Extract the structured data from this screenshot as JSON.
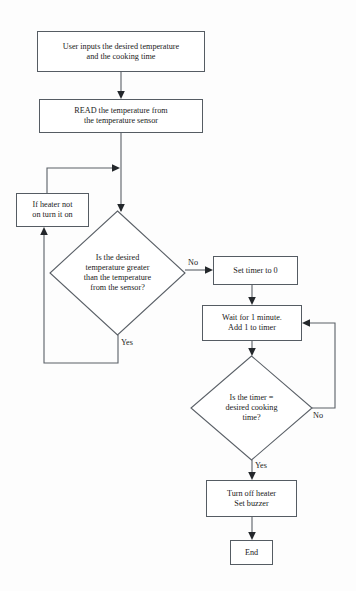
{
  "diagram": {
    "type": "flowchart",
    "nodes": [
      {
        "id": "input",
        "shape": "process",
        "lines": [
          "User inputs the desired temperature",
          "and the cooking time"
        ]
      },
      {
        "id": "read",
        "shape": "process",
        "lines": [
          "READ the temperature from",
          "the temperature sensor"
        ]
      },
      {
        "id": "heater",
        "shape": "process",
        "lines": [
          "If heater not",
          "on turn it on"
        ]
      },
      {
        "id": "decision-temp",
        "shape": "decision",
        "lines": [
          "Is the desired",
          "temperature greater",
          "than the temperature",
          "from the sensor?"
        ]
      },
      {
        "id": "set-timer",
        "shape": "process",
        "lines": [
          "Set timer to 0"
        ]
      },
      {
        "id": "wait",
        "shape": "process",
        "lines": [
          "Wait for 1 minute.",
          "Add 1 to timer"
        ]
      },
      {
        "id": "decision-timer",
        "shape": "decision",
        "lines": [
          "Is the timer =",
          "desired cooking",
          "time?"
        ]
      },
      {
        "id": "turn-off",
        "shape": "process",
        "lines": [
          "Turn off heater",
          "Set buzzer"
        ]
      },
      {
        "id": "end",
        "shape": "terminator",
        "lines": [
          "End"
        ]
      }
    ],
    "edge_labels": {
      "decision_temp_no": "No",
      "decision_temp_yes": "Yes",
      "decision_timer_no": "No",
      "decision_timer_yes": "Yes"
    },
    "colors": {
      "stroke": "#5a6067",
      "text": "#1a1a1a",
      "background": "#fdfdfd"
    }
  }
}
